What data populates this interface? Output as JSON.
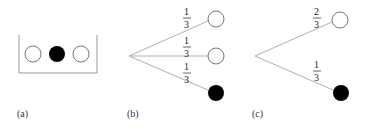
{
  "panels": [
    {
      "id": "a",
      "label": "(a)",
      "description": "Box containing three balls: white, black, white",
      "balls": [
        "white",
        "black",
        "white"
      ]
    },
    {
      "id": "b",
      "label": "(b)",
      "description": "Tree with three branches",
      "branches": [
        {
          "prob_num": "1",
          "prob_den": "3",
          "outcome": "white"
        },
        {
          "prob_num": "1",
          "prob_den": "3",
          "outcome": "white"
        },
        {
          "prob_num": "1",
          "prob_den": "3",
          "outcome": "black"
        }
      ]
    },
    {
      "id": "c",
      "label": "(c)",
      "description": "Tree with two branches",
      "branches": [
        {
          "prob_num": "2",
          "prob_den": "3",
          "outcome": "white"
        },
        {
          "prob_num": "1",
          "prob_den": "3",
          "outcome": "black"
        }
      ]
    }
  ],
  "colors": {
    "line": "#b0b0b0",
    "ball_outline": "#555555",
    "ball_black": "#000000",
    "ball_white": "#ffffff",
    "box": "#999999"
  }
}
